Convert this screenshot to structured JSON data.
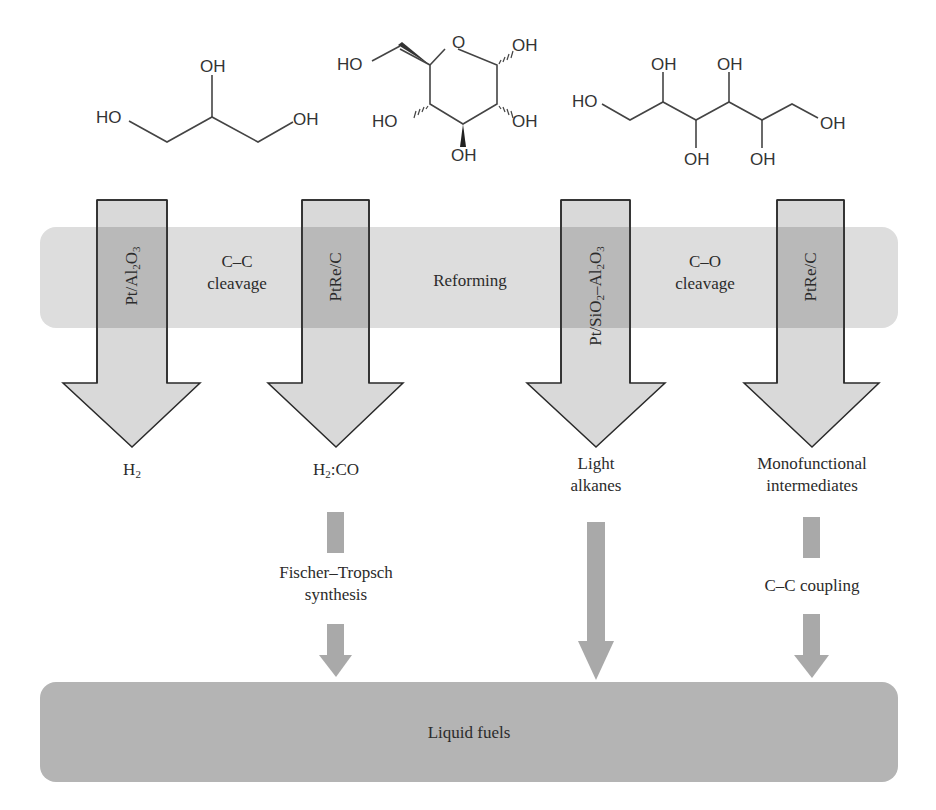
{
  "figure": {
    "molecules": [
      {
        "name": "glycerol",
        "labels": [
          "HO",
          "OH",
          "OH"
        ]
      },
      {
        "name": "glucose",
        "labels": [
          "HO",
          "O",
          "OH",
          "HO",
          "OH",
          "OH"
        ]
      },
      {
        "name": "sorbitol",
        "labels": [
          "HO",
          "OH",
          "OH",
          "OH",
          "OH",
          "OH"
        ]
      }
    ],
    "reforming_band": {
      "title": "Reforming",
      "cc_cleavage_line1": "C–C",
      "cc_cleavage_line2": "cleavage",
      "co_cleavage_line1": "C–O",
      "co_cleavage_line2": "cleavage"
    },
    "catalysts": [
      {
        "main": "Pt/Al",
        "sub1": "2",
        "mid": "O",
        "sub2": "3",
        "full": "Pt/Al2O3"
      },
      {
        "main": "PtRe/C",
        "full": "PtRe/C"
      },
      {
        "full": "Pt/SiO2–Al2O3",
        "p1": "Pt/SiO",
        "s1": "2",
        "p2": "–Al",
        "s2": "2",
        "p3": "O",
        "s3": "3"
      },
      {
        "main": "PtRe/C",
        "full": "PtRe/C"
      }
    ],
    "products": [
      {
        "line1_main": "H",
        "line1_sub": "2",
        "full": "H2"
      },
      {
        "line1_main": "H",
        "line1_sub": "2",
        "line1_rest": ":CO",
        "full": "H2:CO"
      },
      {
        "line1": "Light",
        "line2": "alkanes"
      },
      {
        "line1": "Monofunctional",
        "line2": "intermediates"
      }
    ],
    "upgrading_steps": {
      "fischer_tropsch_line1": "Fischer–Tropsch",
      "fischer_tropsch_line2": "synthesis",
      "cc_coupling": "C–C coupling"
    },
    "final_product": "Liquid fuels",
    "colors": {
      "band_reforming": "#dddddd",
      "band_fuels": "#b4b4b4",
      "arrow_fill": "#d9d9d9",
      "arrow_inband": "#b9b9b9",
      "small_arrow": "#a9a9a9",
      "outline": "#2a2a2a"
    }
  }
}
